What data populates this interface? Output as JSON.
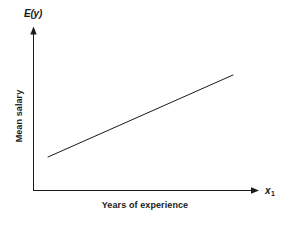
{
  "figure": {
    "background_color": "#ffffff",
    "ink_color": "#1a1a1a",
    "width": 292,
    "height": 225
  },
  "axes": {
    "y_axis": {
      "symbol_label": "E(y)",
      "title": "Mean salary",
      "arrow": "up-arrow-icon",
      "x_px": 33,
      "top_px": 28,
      "bottom_px": 190
    },
    "x_axis": {
      "symbol_label": "x",
      "symbol_subscript": "1",
      "title": "Years of experience",
      "arrow": "right-arrow-icon",
      "y_px": 190,
      "left_px": 33,
      "right_px": 258
    }
  },
  "chart_data": {
    "type": "line",
    "title": "",
    "subtitle": "",
    "xlabel": "Years of experience",
    "ylabel": "Mean salary",
    "x_axis_symbol": "x₁",
    "y_axis_symbol": "E(y)",
    "grid": false,
    "legend": false,
    "legend_position": "none",
    "axis_ticks": false,
    "tick_labels": {
      "x": [],
      "y": []
    },
    "xlim": [
      0,
      1
    ],
    "ylim": [
      0,
      1
    ],
    "annotations": [],
    "series": [
      {
        "name": "Expected mean salary",
        "description": "Straight increasing deterministic relationship E(y) = b0 + b1*x1",
        "color": "#1a1a1a",
        "line_width": 1,
        "markers": false,
        "x": [
          0.067,
          1.0
        ],
        "y": [
          0.204,
          0.71
        ],
        "x_px": [
          48,
          233
        ],
        "y_px": [
          157,
          75
        ],
        "slope_sign": "positive"
      }
    ]
  }
}
